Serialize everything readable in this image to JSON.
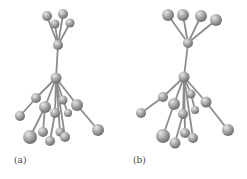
{
  "figure": {
    "panels": [
      {
        "label": "(a)",
        "nodes": [
          [
            47,
            16,
            5
          ],
          [
            63,
            14,
            5
          ],
          [
            55,
            24,
            4.5
          ],
          [
            70,
            23,
            4.5
          ],
          [
            58,
            45,
            5
          ],
          [
            56,
            78,
            5.5
          ],
          [
            36,
            98,
            5
          ],
          [
            45,
            107,
            6
          ],
          [
            77,
            105,
            6
          ],
          [
            63,
            100,
            4.5
          ],
          [
            68,
            113,
            4
          ],
          [
            20,
            116,
            5
          ],
          [
            98,
            130,
            6
          ],
          [
            55,
            113,
            5
          ],
          [
            43,
            132,
            5
          ],
          [
            50,
            141,
            5
          ],
          [
            60,
            132,
            4.5
          ],
          [
            65,
            137,
            5
          ],
          [
            30,
            137,
            7
          ]
        ],
        "edges": [
          [
            0,
            4
          ],
          [
            1,
            4
          ],
          [
            2,
            4
          ],
          [
            3,
            4
          ],
          [
            4,
            5
          ],
          [
            5,
            6
          ],
          [
            5,
            7
          ],
          [
            5,
            8
          ],
          [
            5,
            9
          ],
          [
            9,
            10
          ],
          [
            6,
            11
          ],
          [
            8,
            12
          ],
          [
            5,
            13
          ],
          [
            7,
            14
          ],
          [
            13,
            15
          ],
          [
            5,
            16
          ],
          [
            5,
            17
          ],
          [
            7,
            18
          ]
        ]
      },
      {
        "label": "(b)",
        "nodes": [
          [
            45,
            15,
            6
          ],
          [
            60,
            15,
            6
          ],
          [
            78,
            16,
            6
          ],
          [
            93,
            20,
            6
          ],
          [
            65,
            43,
            5
          ],
          [
            61,
            77,
            5.5
          ],
          [
            40,
            97,
            5
          ],
          [
            51,
            104,
            6
          ],
          [
            83,
            102,
            5.5
          ],
          [
            68,
            94,
            4.5
          ],
          [
            72,
            110,
            4
          ],
          [
            18,
            113,
            5
          ],
          [
            105,
            130,
            6
          ],
          [
            60,
            114,
            5
          ],
          [
            40,
            136,
            7
          ],
          [
            52,
            143,
            5.5
          ],
          [
            62,
            133,
            5
          ],
          [
            70,
            138,
            5
          ]
        ],
        "edges": [
          [
            0,
            4
          ],
          [
            1,
            4
          ],
          [
            2,
            4
          ],
          [
            3,
            4
          ],
          [
            4,
            5
          ],
          [
            5,
            6
          ],
          [
            5,
            7
          ],
          [
            5,
            8
          ],
          [
            5,
            9
          ],
          [
            9,
            10
          ],
          [
            6,
            11
          ],
          [
            8,
            12
          ],
          [
            5,
            13
          ],
          [
            7,
            14
          ],
          [
            13,
            15
          ],
          [
            5,
            16
          ],
          [
            5,
            17
          ]
        ]
      }
    ],
    "colors": {
      "stick": "#8c8c8c",
      "ball_light": "#e6e6e6",
      "ball_dark": "#6e6e6e",
      "label": "#444444"
    }
  }
}
